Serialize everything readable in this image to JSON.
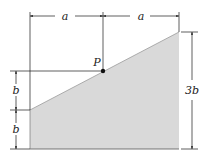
{
  "diagram": {
    "fill_color": "#d8d8d8",
    "line_color": "#1a1a1a",
    "point": {
      "label": "P"
    },
    "dimensions": {
      "top_left": "a",
      "top_right": "a",
      "left_upper": "b",
      "left_lower": "b",
      "right": "3b"
    }
  }
}
